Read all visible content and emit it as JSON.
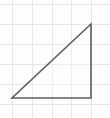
{
  "figure": {
    "canvas": {
      "width": 110,
      "height": 118
    },
    "background_color": "#fdfdfd"
  },
  "grid": {
    "label": "graph-paper-grid",
    "line_color": "#e7e7e7",
    "line_width": 1,
    "spacing_px": 20,
    "vertical_line_x": [
      12,
      32,
      52,
      71,
      91
    ],
    "horizontal_line_y": [
      4,
      24,
      44,
      64,
      84,
      104
    ]
  },
  "shape": {
    "name": "right-triangle",
    "type": "polygon",
    "sides": 3,
    "stroke_color": "#5e5e63",
    "stroke_width": 1.6,
    "fill_color": "#fbfbfb",
    "fill_opacity": 0.35,
    "vertices": [
      {
        "label": "bottom-left-vertex",
        "x": 12,
        "y": 98
      },
      {
        "label": "bottom-right-vertex",
        "x": 91,
        "y": 98
      },
      {
        "label": "top-right-vertex",
        "x": 91,
        "y": 24
      }
    ],
    "points_attr": "12,98 91,98 91,24",
    "edges": [
      {
        "label": "base-horizontal-leg",
        "from": "bottom-left-vertex",
        "to": "bottom-right-vertex",
        "length_px": 79,
        "length_cells": 4
      },
      {
        "label": "vertical-leg",
        "from": "bottom-right-vertex",
        "to": "top-right-vertex",
        "length_px": 74,
        "length_cells": 3.7
      },
      {
        "label": "hypotenuse",
        "from": "top-right-vertex",
        "to": "bottom-left-vertex",
        "length_px": 108
      }
    ],
    "right_angle_at": "bottom-right-vertex"
  },
  "chart_data": {
    "type": "scatter",
    "xlabel": "",
    "ylabel": "",
    "x": [
      12,
      91,
      91,
      12
    ],
    "y": [
      98,
      98,
      24,
      98
    ],
    "series": [
      {
        "name": "right-triangle-outline",
        "values": [
          98,
          98,
          24,
          98
        ]
      }
    ],
    "xlim": [
      0,
      110
    ],
    "ylim": [
      0,
      118
    ],
    "grid": true,
    "legend": "none",
    "annotations": [
      "right angle at bottom-right vertex"
    ]
  }
}
